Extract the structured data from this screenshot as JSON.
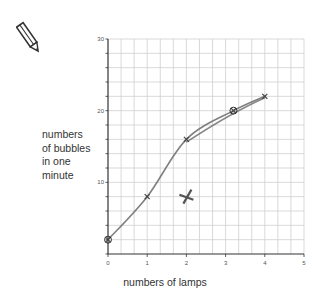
{
  "chart_data": {
    "type": "line",
    "title": "",
    "xlabel": "numbers of lamps",
    "ylabel": "numbers of bubbles in one minute",
    "ylabel_lines": [
      "numbers",
      "of bubbles",
      "in one",
      "minute"
    ],
    "xlim": [
      0,
      5
    ],
    "ylim": [
      0,
      30
    ],
    "x_ticks": [
      "0",
      "1",
      "2",
      "3",
      "4",
      "5"
    ],
    "y_ticks": [
      "10",
      "20",
      "30"
    ],
    "grid": true,
    "grid_minor_x_step": 0.3333,
    "grid_minor_y_step": 2,
    "series": [
      {
        "name": "hand-drawn curve",
        "x": [
          0,
          1,
          2,
          3.2,
          4
        ],
        "y": [
          2,
          8,
          16,
          20,
          22
        ]
      }
    ],
    "annotations": [
      {
        "type": "circled-point",
        "x": 0,
        "y": 2
      },
      {
        "type": "circled-point",
        "x": 3.2,
        "y": 20
      },
      {
        "type": "cross-mark-anomaly",
        "x": 2,
        "y": 8
      }
    ],
    "colors": {
      "curve": "#6a6a6a",
      "grid": "#cfcfcf",
      "axis": "#333333"
    }
  },
  "icons": {
    "pencil": "pencil-icon"
  }
}
